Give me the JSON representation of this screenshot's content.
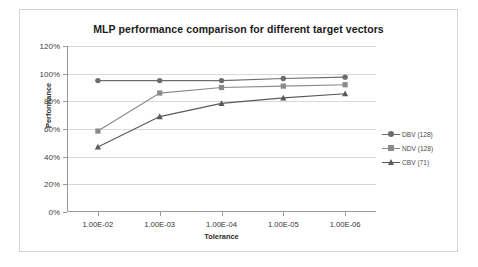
{
  "chart_data": {
    "type": "line",
    "title": "MLP performance comparison for different target vectors",
    "xlabel": "Tolerance",
    "ylabel": "Performance",
    "categories": [
      "1.00E-02",
      "1.00E-03",
      "1.00E-04",
      "1.00E-05",
      "1.00E-06"
    ],
    "ylim": [
      0,
      120
    ],
    "yticks": [
      "0%",
      "20%",
      "40%",
      "60%",
      "80%",
      "100%",
      "120%"
    ],
    "ytick_values": [
      0,
      20,
      40,
      60,
      80,
      100,
      120
    ],
    "grid": true,
    "legend_position": "right",
    "series": [
      {
        "name": "DBV (128)",
        "values": [
          95,
          95,
          95,
          96.5,
          97.5
        ],
        "marker": "diamond",
        "color": "#6d6d6d"
      },
      {
        "name": "NDV (128)",
        "values": [
          58.5,
          86,
          90,
          91,
          92
        ],
        "marker": "square",
        "color": "#8a8a8a"
      },
      {
        "name": "CBV (71)",
        "values": [
          47,
          69,
          78.5,
          82.5,
          85.5
        ],
        "marker": "triangle",
        "color": "#5a5a5a"
      }
    ]
  },
  "legend": {
    "items": [
      {
        "label": "DBV (128)"
      },
      {
        "label": "NDV (128)"
      },
      {
        "label": "CBV (71)"
      }
    ]
  },
  "style": {
    "grid_color": "#d9d9d9",
    "axis_color": "#9a9a9a",
    "frame_color": "#d4d4d4",
    "background": "#ffffff"
  }
}
